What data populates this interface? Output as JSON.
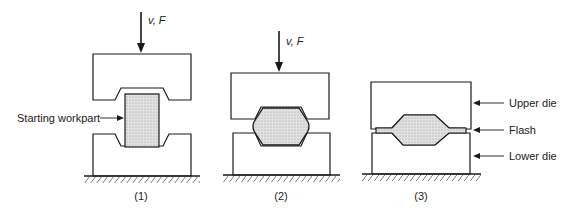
{
  "diagram": {
    "stages": [
      {
        "caption": "(1)",
        "force_label": "v, F",
        "callout": "Starting workpart"
      },
      {
        "caption": "(2)",
        "force_label": "v, F"
      },
      {
        "caption": "(3)",
        "callouts": [
          "Upper die",
          "Flash",
          "Lower die"
        ]
      }
    ],
    "colors": {
      "stroke": "#1a1a1a",
      "workpart_fill": "#d8d8d8",
      "background": "#ffffff"
    }
  }
}
